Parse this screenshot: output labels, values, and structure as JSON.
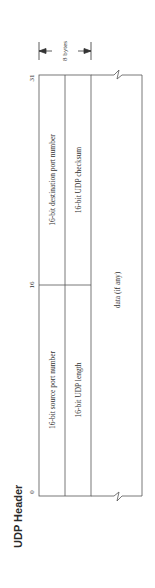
{
  "title": "UDP Header",
  "bit_markers": {
    "start": "0",
    "middle": "16",
    "end": "31"
  },
  "size_annotation": "8 bytes",
  "fields": [
    {
      "name": "source-port",
      "label": "16-bit source port number",
      "row": 0,
      "half": "left"
    },
    {
      "name": "destination-port",
      "label": "16-bit destination port number",
      "row": 0,
      "half": "right"
    },
    {
      "name": "udp-length",
      "label": "16-bit UDP length",
      "row": 1,
      "half": "left"
    },
    {
      "name": "udp-checksum",
      "label": "16-bit UDP checksum",
      "row": 1,
      "half": "right"
    }
  ],
  "data_block": {
    "label": "data (if any)"
  },
  "colors": {
    "line": "#555555",
    "text": "#333333",
    "background": "#ffffff"
  }
}
